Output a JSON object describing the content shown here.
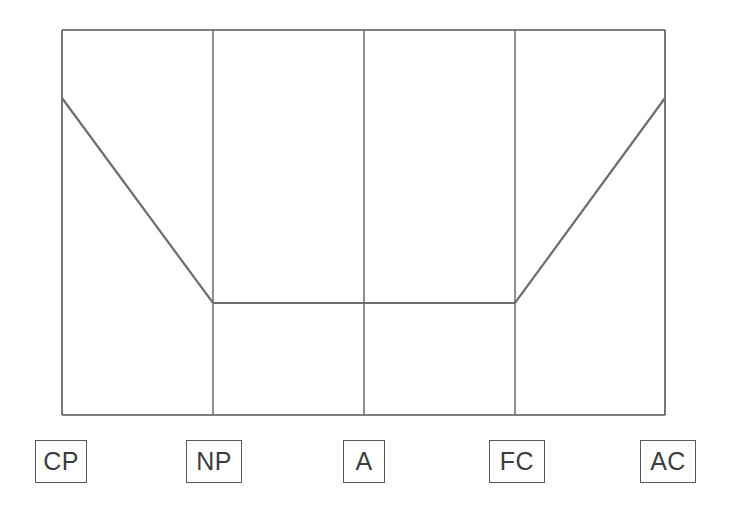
{
  "chart_data": {
    "type": "line",
    "title": "",
    "subtitle": "",
    "xlabel": "",
    "ylabel": "",
    "categories": [
      "CP",
      "NP",
      "A",
      "FC",
      "AC"
    ],
    "category_names": [
      "Critical Parent",
      "Nurturing Parent",
      "Adult",
      "Free Child",
      "Adapted Child"
    ],
    "series": [
      {
        "name": "Ego state score",
        "values": [
          15,
          8,
          8,
          8,
          15
        ]
      }
    ],
    "values": [
      15,
      8,
      8,
      8,
      15
    ],
    "ylim": [
      0,
      20
    ],
    "grid": "vertical-only",
    "legend": "none",
    "annotations": [],
    "line_color": "#6d6d6d",
    "frame_color": "#555555",
    "gridline_color": "#6a6a6a",
    "background_color": "#ffffff",
    "shape_description": "V-shaped profile: high at CP and AC, flat low plateau across NP, A and FC"
  },
  "chart": {
    "frame": {
      "left": 62,
      "top": 30,
      "right": 665,
      "bottom": 415
    },
    "column_x": [
      62,
      213,
      364,
      515,
      665
    ],
    "point_y": [
      98,
      303,
      303,
      303,
      98
    ]
  },
  "axis_labels": [
    {
      "text": "CP",
      "name": "axis-label-cp",
      "x": 35,
      "y": 440,
      "w": 52,
      "h": 43
    },
    {
      "text": "NP",
      "name": "axis-label-np",
      "x": 186,
      "y": 440,
      "w": 56,
      "h": 43
    },
    {
      "text": "A",
      "name": "axis-label-a",
      "x": 343,
      "y": 440,
      "w": 42,
      "h": 43
    },
    {
      "text": "FC",
      "name": "axis-label-fc",
      "x": 489,
      "y": 440,
      "w": 56,
      "h": 43
    },
    {
      "text": "AC",
      "name": "axis-label-ac",
      "x": 640,
      "y": 440,
      "w": 56,
      "h": 43
    }
  ]
}
